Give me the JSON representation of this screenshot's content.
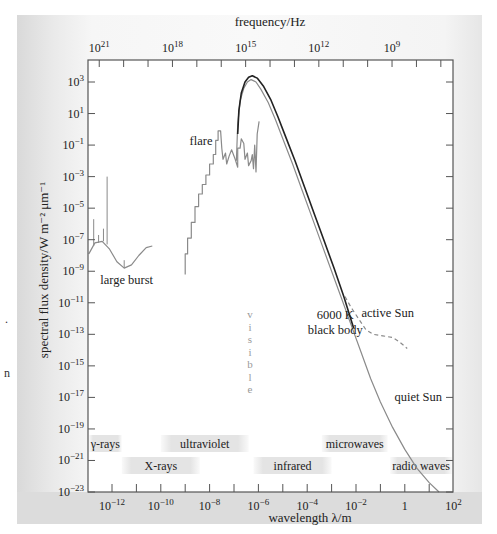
{
  "chart_data": {
    "type": "line",
    "title": "",
    "xlabel": "wavelength λ/m",
    "ylabel": "spectral flux density/W m⁻² μm⁻¹",
    "x_scale": "log",
    "y_scale": "log",
    "xlim_log10": [
      -13,
      2
    ],
    "ylim_log10": [
      -23,
      4.4
    ],
    "x_ticks": [
      {
        "exp": -12,
        "label": "10",
        "sup": "−12"
      },
      {
        "exp": -10,
        "label": "10",
        "sup": "−10"
      },
      {
        "exp": -8,
        "label": "10",
        "sup": "−8"
      },
      {
        "exp": -6,
        "label": "10",
        "sup": "−6"
      },
      {
        "exp": -4,
        "label": "10",
        "sup": "−4"
      },
      {
        "exp": -2,
        "label": "10",
        "sup": "−2"
      },
      {
        "exp": 0,
        "label": "1",
        "sup": ""
      },
      {
        "exp": 2,
        "label": "10",
        "sup": "2"
      }
    ],
    "y_ticks": [
      {
        "exp": 3,
        "sup": "3"
      },
      {
        "exp": 1,
        "sup": "1"
      },
      {
        "exp": -1,
        "sup": "−1"
      },
      {
        "exp": -3,
        "sup": "−3"
      },
      {
        "exp": -5,
        "sup": "−5"
      },
      {
        "exp": -7,
        "sup": "−7"
      },
      {
        "exp": -9,
        "sup": "−9"
      },
      {
        "exp": -11,
        "sup": "−11"
      },
      {
        "exp": -13,
        "sup": "−13"
      },
      {
        "exp": -15,
        "sup": "−15"
      },
      {
        "exp": -17,
        "sup": "−17"
      },
      {
        "exp": -19,
        "sup": "−19"
      },
      {
        "exp": -21,
        "sup": "−21"
      },
      {
        "exp": -23,
        "sup": "−23"
      }
    ],
    "top_axis": {
      "label": "frequency/Hz",
      "ticks": [
        {
          "exp": 21,
          "sup": "21"
        },
        {
          "exp": 18,
          "sup": "18"
        },
        {
          "exp": 15,
          "sup": "15"
        },
        {
          "exp": 12,
          "sup": "12"
        },
        {
          "exp": 9,
          "sup": "9"
        }
      ]
    },
    "series": [
      {
        "name": "quiet Sun",
        "style": "solid-gray",
        "color": "#8a8a8a",
        "points_log10": [
          [
            -6.9,
            -2.0
          ],
          [
            -6.85,
            0.3
          ],
          [
            -6.75,
            1.8
          ],
          [
            -6.6,
            2.6
          ],
          [
            -6.45,
            3.0
          ],
          [
            -6.3,
            3.15
          ],
          [
            -6.1,
            3.0
          ],
          [
            -5.9,
            2.55
          ],
          [
            -5.6,
            1.7
          ],
          [
            -5.3,
            0.6
          ],
          [
            -5.0,
            -0.6
          ],
          [
            -4.6,
            -2.2
          ],
          [
            -4.2,
            -3.9
          ],
          [
            -3.8,
            -5.6
          ],
          [
            -3.4,
            -7.3
          ],
          [
            -3.0,
            -9.0
          ],
          [
            -2.6,
            -10.7
          ],
          [
            -2.2,
            -12.4
          ],
          [
            -1.8,
            -14.1
          ],
          [
            -1.4,
            -15.8
          ],
          [
            -1.0,
            -17.3
          ],
          [
            -0.5,
            -18.9
          ],
          [
            0.0,
            -20.3
          ],
          [
            0.5,
            -21.5
          ],
          [
            1.0,
            -22.4
          ],
          [
            1.4,
            -23.0
          ]
        ]
      },
      {
        "name": "6000 K black body",
        "style": "solid-black",
        "color": "#222222",
        "points_log10": [
          [
            -6.85,
            -0.3
          ],
          [
            -6.8,
            1.2
          ],
          [
            -6.7,
            2.3
          ],
          [
            -6.55,
            3.0
          ],
          [
            -6.4,
            3.3
          ],
          [
            -6.25,
            3.4
          ],
          [
            -6.05,
            3.25
          ],
          [
            -5.8,
            2.75
          ],
          [
            -5.5,
            1.9
          ],
          [
            -5.2,
            0.8
          ],
          [
            -4.9,
            -0.4
          ],
          [
            -4.5,
            -2.0
          ],
          [
            -4.1,
            -3.7
          ],
          [
            -3.7,
            -5.4
          ],
          [
            -3.3,
            -7.1
          ],
          [
            -2.9,
            -8.8
          ],
          [
            -2.5,
            -10.6
          ],
          [
            -2.1,
            -12.6
          ]
        ]
      },
      {
        "name": "active Sun",
        "style": "dashed-gray",
        "color": "#8a8a8a",
        "points_log10": [
          [
            -2.45,
            -10.6
          ],
          [
            -2.2,
            -11.3
          ],
          [
            -1.9,
            -12.0
          ],
          [
            -1.6,
            -12.7
          ],
          [
            -1.3,
            -13.0
          ],
          [
            -0.9,
            -13.1
          ],
          [
            -0.5,
            -13.2
          ],
          [
            -0.2,
            -13.5
          ],
          [
            0.1,
            -13.9
          ]
        ]
      },
      {
        "name": "flare",
        "style": "stepped-gray",
        "color": "#8a8a8a",
        "points_log10": [
          [
            -9.0,
            -9.2
          ],
          [
            -9.0,
            -7.9
          ],
          [
            -8.9,
            -7.9
          ],
          [
            -8.9,
            -6.9
          ],
          [
            -8.75,
            -6.9
          ],
          [
            -8.75,
            -5.9
          ],
          [
            -8.6,
            -5.9
          ],
          [
            -8.6,
            -4.9
          ],
          [
            -8.45,
            -4.9
          ],
          [
            -8.45,
            -4.1
          ],
          [
            -8.3,
            -4.1
          ],
          [
            -8.3,
            -3.5
          ],
          [
            -8.15,
            -3.5
          ],
          [
            -8.15,
            -2.9
          ],
          [
            -8.0,
            -2.9
          ],
          [
            -8.0,
            -2.2
          ],
          [
            -7.85,
            -2.2
          ],
          [
            -7.85,
            -1.6
          ],
          [
            -7.75,
            -1.6
          ],
          [
            -7.75,
            -0.7
          ],
          [
            -7.65,
            -0.7
          ],
          [
            -7.65,
            -0.1
          ],
          [
            -7.55,
            -0.1
          ],
          [
            -7.5,
            -1.2
          ],
          [
            -7.45,
            -1.9
          ],
          [
            -7.35,
            -1.5
          ],
          [
            -7.3,
            -2.2
          ],
          [
            -7.2,
            -1.7
          ],
          [
            -7.1,
            -1.3
          ],
          [
            -6.95,
            -1.9
          ],
          [
            -6.85,
            -2.4
          ],
          [
            -6.85,
            -1.2
          ],
          [
            -6.75,
            -1.2
          ],
          [
            -6.7,
            -0.6
          ],
          [
            -6.6,
            -0.9
          ],
          [
            -6.55,
            -1.9
          ],
          [
            -6.45,
            -1.5
          ],
          [
            -6.4,
            -2.3
          ],
          [
            -6.3,
            -2.0
          ],
          [
            -6.25,
            -1.6
          ],
          [
            -6.2,
            -2.5
          ],
          [
            -6.15,
            -1.0
          ],
          [
            -6.1,
            -2.7
          ],
          [
            -6.05,
            -0.3
          ],
          [
            -5.97,
            0.5
          ]
        ]
      },
      {
        "name": "large burst",
        "style": "solid-gray",
        "color": "#8a8a8a",
        "points_log10": [
          [
            -12.95,
            -7.9
          ],
          [
            -12.7,
            -7.2
          ],
          [
            -12.4,
            -7.1
          ],
          [
            -12.1,
            -7.6
          ],
          [
            -11.8,
            -8.4
          ],
          [
            -11.5,
            -8.8
          ],
          [
            -11.2,
            -8.6
          ],
          [
            -10.9,
            -8.0
          ],
          [
            -10.6,
            -7.5
          ],
          [
            -10.35,
            -7.4
          ]
        ]
      }
    ],
    "spikes_log10": [
      {
        "x": -12.75,
        "y0": -7.4,
        "y1": -5.7
      },
      {
        "x": -12.55,
        "y0": -7.2,
        "y1": -6.7
      },
      {
        "x": -12.35,
        "y0": -7.1,
        "y1": -6.3
      },
      {
        "x": -12.2,
        "y0": -7.3,
        "y1": -3.0
      },
      {
        "x": -11.5,
        "y0": -8.8,
        "y1": -8.3
      }
    ],
    "annotations": [
      {
        "text": "flare",
        "x_log10": -8.35,
        "y_log10": -1.0
      },
      {
        "text": "large burst",
        "x_log10": -11.4,
        "y_log10": -9.8
      },
      {
        "text": "active Sun",
        "x_log10": -0.7,
        "y_log10": -11.9
      },
      {
        "text": "6000 K",
        "x_log10": -2.85,
        "y_log10": -12.0
      },
      {
        "text": "black body",
        "x_log10": -2.85,
        "y_log10": -13.0
      },
      {
        "text": "quiet Sun",
        "x_log10": 0.55,
        "y_log10": -17.2
      }
    ],
    "visible_label": "visible",
    "bands": [
      {
        "label": "γ-rays",
        "row": 1,
        "x_from_log10": -13,
        "x_to_log10": -11.6
      },
      {
        "label": "X-rays",
        "row": 2,
        "x_from_log10": -11.6,
        "x_to_log10": -8.4
      },
      {
        "label": "ultraviolet",
        "row": 1,
        "x_from_log10": -10.0,
        "x_to_log10": -6.4
      },
      {
        "label": "infrared",
        "row": 2,
        "x_from_log10": -6.2,
        "x_to_log10": -3.0
      },
      {
        "label": "microwaves",
        "row": 1,
        "x_from_log10": -3.4,
        "x_to_log10": -0.7
      },
      {
        "label": "radio waves",
        "row": 2,
        "x_from_log10": -0.6,
        "x_to_log10": 2.0
      }
    ],
    "grid": false,
    "legend": "none (inline annotations)"
  },
  "stray_text": [
    ".",
    "n"
  ]
}
